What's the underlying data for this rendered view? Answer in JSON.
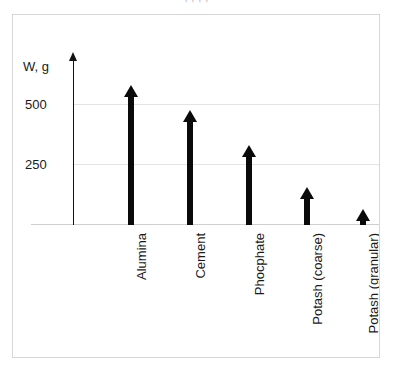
{
  "top_cutoff_text": ",  ,  ,  ,",
  "chart_data": {
    "type": "bar",
    "title": "",
    "subtitle": "",
    "xlabel": "",
    "ylabel": "W, g",
    "categories": [
      "Alumina",
      "Cement",
      "Phocphate",
      "Potash (coarse)",
      "Potash (granular)"
    ],
    "values": [
      583,
      479,
      333,
      158,
      67
    ],
    "ylim": [
      0,
      600
    ],
    "yticks": [
      250,
      500
    ],
    "ytick_labels": [
      "250",
      "500"
    ],
    "grid": true,
    "legend": "none",
    "marker_style": "upward-arrow-bars",
    "series": [
      {
        "name": "W, g",
        "values": [
          583,
          479,
          333,
          158,
          67
        ]
      }
    ]
  },
  "axis": {
    "y_title": "W, g",
    "y_arrow": "up-arrow-icon"
  }
}
